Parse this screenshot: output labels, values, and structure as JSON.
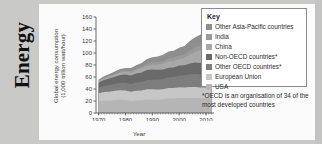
{
  "section": {
    "title": "Energy"
  },
  "legend": {
    "title": "Key",
    "items": [
      {
        "label": "Other Asia-Pacific countries",
        "color": "#8e8e8e"
      },
      {
        "label": "India",
        "color": "#9a9a9a"
      },
      {
        "label": "China",
        "color": "#a8a8a8"
      },
      {
        "label": "Non-OECD countries*",
        "color": "#6a6a6a"
      },
      {
        "label": "Other OECD countries*",
        "color": "#7d7d7d"
      },
      {
        "label": "European Union",
        "color": "#c6c6c6"
      },
      {
        "label": "USA",
        "color": "#b5b5b5"
      }
    ]
  },
  "footnote": {
    "text": "*OECD is an organisation of 34 of the most developed countries"
  },
  "chart_data": {
    "type": "area",
    "title": "",
    "xlabel": "Year",
    "ylabel": "Global energy consumption (1,000 trillion watt/hour)",
    "ylabel_line1": "Global energy consumption",
    "ylabel_line2": "(1,000 trillion watt/hour)",
    "xlim": [
      1969,
      2013
    ],
    "ylim": [
      0,
      160
    ],
    "yticks": [
      0,
      20,
      40,
      60,
      80,
      100,
      120,
      140,
      160
    ],
    "xticks": [
      1970,
      1980,
      1990,
      2000,
      2010
    ],
    "grid": false,
    "stacked": true,
    "legend_position": "right",
    "x": [
      1970,
      1972,
      1974,
      1976,
      1978,
      1980,
      1982,
      1984,
      1986,
      1988,
      1990,
      1992,
      1994,
      1996,
      1998,
      2000,
      2002,
      2004,
      2006,
      2008,
      2010,
      2012
    ],
    "series": [
      {
        "name": "USA",
        "color": "#b5b5b5",
        "values": [
          19.5,
          20.5,
          20.5,
          21.5,
          22.0,
          21.5,
          20.0,
          21.0,
          21.0,
          22.5,
          22.5,
          22.5,
          23.0,
          24.0,
          24.0,
          25.0,
          24.5,
          25.0,
          25.0,
          24.5,
          24.5,
          24.0
        ]
      },
      {
        "name": "European Union",
        "color": "#c6c6c6",
        "values": [
          13.5,
          14.5,
          15.0,
          15.5,
          16.0,
          16.0,
          15.5,
          16.0,
          16.5,
          17.0,
          17.0,
          16.5,
          16.5,
          17.5,
          17.5,
          18.0,
          18.0,
          18.5,
          18.5,
          18.0,
          18.0,
          17.5
        ]
      },
      {
        "name": "Other OECD countries*",
        "color": "#7d7d7d",
        "values": [
          9.0,
          10.0,
          11.0,
          11.5,
          12.5,
          13.0,
          13.0,
          14.0,
          14.5,
          15.5,
          16.0,
          16.5,
          17.0,
          18.0,
          18.5,
          19.5,
          20.0,
          21.0,
          21.5,
          21.5,
          22.0,
          22.0
        ]
      },
      {
        "name": "Non-OECD countries*",
        "color": "#6a6a6a",
        "values": [
          9.0,
          10.0,
          11.0,
          12.0,
          13.0,
          13.5,
          14.0,
          15.0,
          15.5,
          16.5,
          17.0,
          16.5,
          16.0,
          16.0,
          16.0,
          16.5,
          17.0,
          18.0,
          19.0,
          19.5,
          20.0,
          20.5
        ]
      },
      {
        "name": "China",
        "color": "#a8a8a8",
        "values": [
          2.0,
          2.5,
          3.0,
          3.5,
          4.0,
          4.5,
          5.0,
          5.5,
          6.5,
          7.5,
          8.0,
          8.5,
          9.5,
          10.5,
          10.5,
          11.0,
          12.0,
          15.0,
          18.0,
          21.0,
          25.0,
          28.0
        ]
      },
      {
        "name": "India",
        "color": "#9a9a9a",
        "values": [
          1.0,
          1.2,
          1.4,
          1.6,
          1.8,
          2.0,
          2.3,
          2.6,
          3.0,
          3.4,
          3.8,
          4.2,
          4.6,
          5.0,
          5.4,
          5.8,
          6.2,
          6.8,
          7.4,
          8.0,
          8.8,
          9.5
        ]
      },
      {
        "name": "Other Asia-Pacific countries",
        "color": "#8e8e8e",
        "values": [
          2.0,
          2.5,
          3.0,
          3.5,
          4.0,
          4.5,
          5.0,
          5.5,
          6.5,
          7.5,
          8.5,
          9.5,
          10.5,
          11.5,
          12.0,
          13.0,
          14.0,
          15.5,
          17.0,
          18.5,
          20.0,
          21.5
        ]
      }
    ],
    "totals": [
      56,
      61,
      65,
      69,
      73,
      75,
      75,
      79,
      83,
      90,
      93,
      94,
      97,
      102,
      104,
      109,
      112,
      120,
      126,
      131,
      138,
      143
    ]
  }
}
